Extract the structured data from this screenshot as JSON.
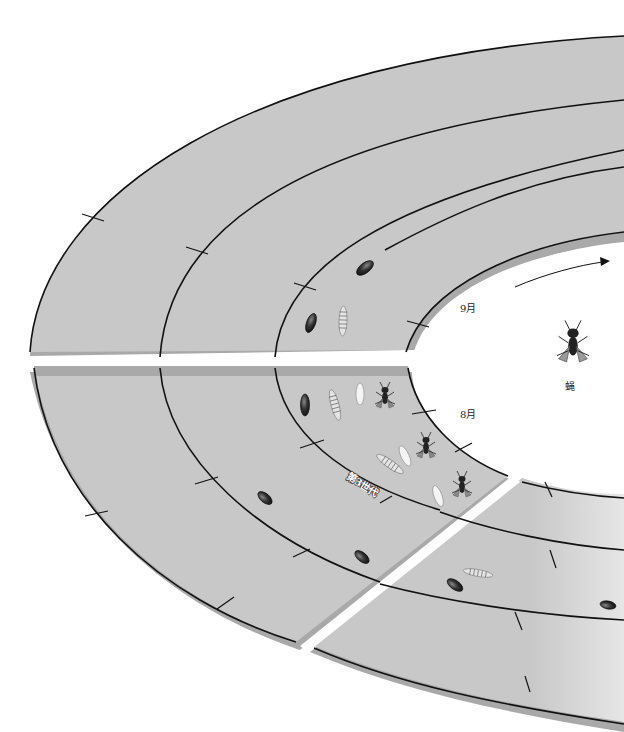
{
  "diagram": {
    "colors": {
      "band_fill": "#c8c8c8",
      "band_shadow": "#a9a9a9",
      "line": "#111111",
      "background": "#ffffff",
      "gap": "#ffffff"
    },
    "labels": {
      "month_september": "9月",
      "month_august": "8月",
      "generation": "第3世代",
      "adult_stage": "蝇"
    },
    "direction_arrow": "clockwise-arrow",
    "stages_shown": [
      "egg",
      "larva",
      "pupa",
      "adult"
    ]
  }
}
